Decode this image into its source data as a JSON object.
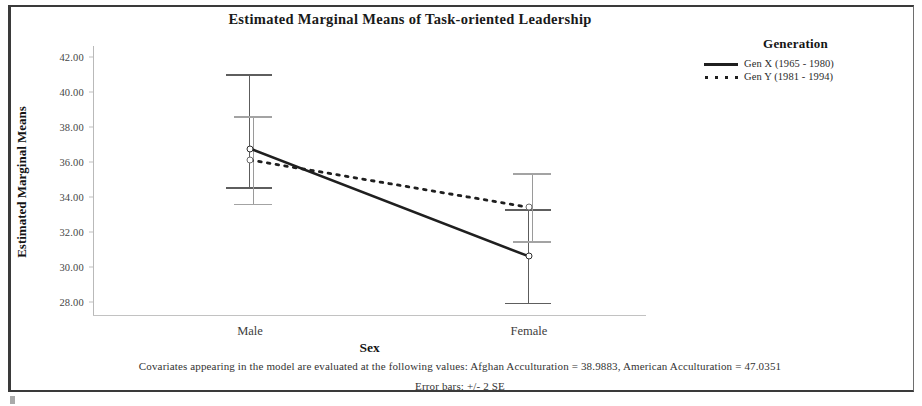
{
  "chart_data": {
    "type": "line",
    "title": "Estimated Marginal Means of Task-oriented Leadership",
    "xlabel": "Sex",
    "ylabel": "Estimated Marginal Means",
    "categories": [
      "Male",
      "Female"
    ],
    "ylim": [
      27.2,
      42.6
    ],
    "yticks": [
      "42.00",
      "40.00",
      "38.00",
      "36.00",
      "34.00",
      "32.00",
      "30.00",
      "28.00"
    ],
    "ytick_values": [
      42.0,
      40.0,
      38.0,
      36.0,
      34.0,
      32.0,
      30.0,
      28.0
    ],
    "grid": false,
    "legend_position": "right",
    "legend_title": "Generation",
    "series": [
      {
        "name": "Gen X (1965 - 1980)",
        "style": "solid",
        "values": [
          36.75,
          30.6
        ],
        "error_low": [
          34.55,
          27.95
        ],
        "error_high": [
          41.0,
          33.3
        ]
      },
      {
        "name": "Gen Y (1981 - 1994)",
        "style": "dotted",
        "values": [
          36.1,
          33.4
        ],
        "error_low": [
          33.6,
          31.45
        ],
        "error_high": [
          38.6,
          35.35
        ]
      }
    ],
    "annotations": [
      "Covariates appearing in the model are evaluated at the following values: Afghan Acculturation = 38.9883, American Acculturation = 47.0351",
      "Error bars: +/- 2 SE"
    ]
  },
  "notes": {
    "covariates": "Covariates appearing in the model are evaluated at the following values: Afghan Acculturation = 38.9883, American Acculturation = 47.0351",
    "error_bars": "Error bars: +/- 2 SE"
  },
  "colors": {
    "gen_x_line": "#1f1f1f",
    "gen_y_line": "#1f1f1f",
    "axis": "#b9b9b9",
    "error_bar": "#6a6a6a",
    "text": "#1a1a1a"
  }
}
